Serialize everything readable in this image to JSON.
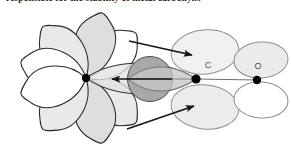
{
  "figure": {
    "caption": "responsible for the stability of metal carbonyls.",
    "type": "orbital-bonding-diagram",
    "colors": {
      "lobe_fill_light": "#efefef",
      "lobe_fill_mid": "#dcdcdc",
      "lobe_fill_dark": "#a8a8a8",
      "lobe_fill_white": "#ffffff",
      "outline_dark": "#2b2b2b",
      "outline_light": "#9a9a9a",
      "arrow": "#1a1a1a",
      "atom_dot": "#000000",
      "label_text": "#4d4d4d",
      "background": "#ffffff"
    },
    "atoms": [
      {
        "id": "metal",
        "label": "",
        "x": 86,
        "y": 78,
        "r": 4.2
      },
      {
        "id": "carbon",
        "label": "C",
        "x": 196,
        "y": 79,
        "r": 4.6,
        "label_x": 208,
        "label_y": 68
      },
      {
        "id": "oxygen",
        "label": "O",
        "x": 257,
        "y": 80,
        "r": 4.2,
        "label_x": 258,
        "label_y": 69
      }
    ],
    "arrows": [
      {
        "id": "sigma-donation",
        "from_x": 172,
        "from_y": 79,
        "to_x": 112,
        "to_y": 79,
        "direction": "left"
      },
      {
        "id": "pi-backbond-upper",
        "from_x": 129,
        "from_y": 41,
        "to_x": 194,
        "to_y": 55,
        "direction": "upper-right"
      },
      {
        "id": "pi-backbond-lower",
        "from_x": 127,
        "from_y": 129,
        "to_x": 196,
        "to_y": 106,
        "direction": "lower-right"
      }
    ],
    "metal_orbital_petals": 8,
    "co_pi_star_lobes": 4
  }
}
